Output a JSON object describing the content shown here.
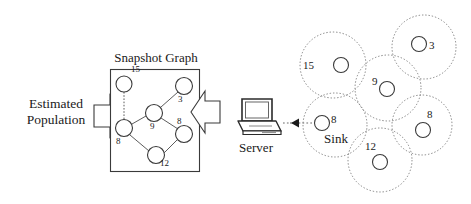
{
  "figure": {
    "title": "Snapshot Graph",
    "width": 471,
    "height": 204,
    "background": "#ffffff",
    "stroke": "#3a3a3a"
  },
  "left_output": {
    "label_line1": "Estimated",
    "label_line2": "Population",
    "arrow": "block-arrow-left"
  },
  "snapshot_graph": {
    "title": "Snapshot Graph",
    "box": {
      "x": 110,
      "y": 69,
      "width": 90,
      "height": 103
    },
    "nodes": [
      {
        "id": "n15",
        "label": "15",
        "cx": 124,
        "cy": 84,
        "r": 8,
        "label_x": 131,
        "label_y": 70
      },
      {
        "id": "n3",
        "label": "3",
        "cx": 184,
        "cy": 86,
        "r": 8.5,
        "label_x": 179,
        "label_y": 96
      },
      {
        "id": "n9",
        "label": "9",
        "cx": 154,
        "cy": 113,
        "r": 8.5,
        "label_x": 150,
        "label_y": 123
      },
      {
        "id": "n8a",
        "label": "8",
        "cx": 124,
        "cy": 128,
        "r": 8.5,
        "label_x": 117,
        "label_y": 139
      },
      {
        "id": "n8b",
        "label": "8",
        "cx": 184,
        "cy": 134,
        "r": 8.5,
        "label_x": 178,
        "label_y": 118
      },
      {
        "id": "n12",
        "label": "12",
        "cx": 156,
        "cy": 155,
        "r": 8.5,
        "label_x": 161,
        "label_y": 158
      }
    ],
    "edges": [
      {
        "from": "n15",
        "to": "n8a"
      },
      {
        "from": "n3",
        "to": "n9"
      },
      {
        "from": "n9",
        "to": "n8a"
      },
      {
        "from": "n9",
        "to": "n8b"
      },
      {
        "from": "n8a",
        "to": "n12"
      },
      {
        "from": "n12",
        "to": "n8b"
      }
    ]
  },
  "transfer_arrow": {
    "name": "block-arrow-left-to-graph"
  },
  "server": {
    "label": "Server",
    "icon": "laptop-icon",
    "x": 238,
    "y": 98
  },
  "data_link": {
    "style": "dotted-arrow-left",
    "from_x": 310,
    "to_x": 265,
    "y": 123
  },
  "sensor_network": {
    "sink_label": "Sink",
    "clusters": [
      {
        "id": "c15",
        "label": "15",
        "cx": 333,
        "cy": 65,
        "r": 33,
        "node_r": 8,
        "node_cx": 341,
        "node_cy": 65,
        "label_x": 308,
        "label_y": 62
      },
      {
        "id": "c3",
        "label": "3",
        "cx": 424,
        "cy": 47,
        "r": 32,
        "node_r": 8,
        "node_cx": 419,
        "node_cy": 44,
        "label_x": 431,
        "label_y": 40
      },
      {
        "id": "c9",
        "label": "9",
        "cx": 388,
        "cy": 88,
        "r": 33,
        "node_r": 8,
        "node_cx": 387,
        "node_cy": 89,
        "label_x": 372,
        "label_y": 80
      },
      {
        "id": "c8r",
        "label": "8",
        "cx": 422,
        "cy": 125,
        "r": 30,
        "node_r": 8,
        "node_cx": 423,
        "node_cy": 130,
        "label_x": 426,
        "label_y": 110
      },
      {
        "id": "csink",
        "label": "8",
        "cx": 335,
        "cy": 125,
        "r": 32,
        "node_r": 8,
        "node_cx": 332,
        "node_cy": 123,
        "label_x": 341,
        "label_y": 115
      },
      {
        "id": "c12",
        "label": "12",
        "cx": 380,
        "cy": 160,
        "r": 32,
        "node_r": 8,
        "node_cx": 380,
        "node_cy": 162,
        "label_x": 366,
        "label_y": 143
      }
    ]
  }
}
